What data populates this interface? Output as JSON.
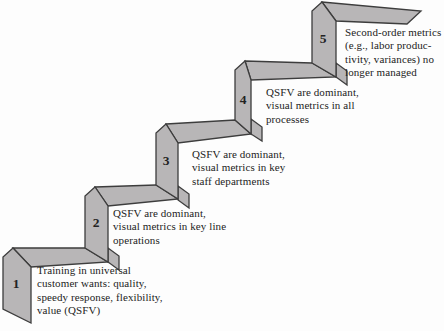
{
  "diagram": {
    "type": "staircase-maturity-diagram",
    "colors": {
      "background": "#fdfdfd",
      "shape_fill": "#b8b6b7",
      "shape_stroke": "#3d3d3d",
      "text": "#232323"
    },
    "steps": [
      {
        "number": "1",
        "label_lines": [
          "Training in universal",
          "customer wants: quality,",
          "speedy response, flexibility,",
          "value (QSFV)"
        ]
      },
      {
        "number": "2",
        "label_lines": [
          "QSFV are dominant,",
          "visual metrics in key line",
          "operations"
        ]
      },
      {
        "number": "3",
        "label_lines": [
          "QSFV are dominant,",
          "visual metrics in key",
          "staff departments"
        ]
      },
      {
        "number": "4",
        "label_lines": [
          "QSFV are dominant,",
          "visual metrics in all",
          "processes"
        ]
      },
      {
        "number": "5",
        "label_lines": [
          "Second-order metrics",
          "(e.g., labor produc-",
          "tivity, variances) no",
          "longer managed"
        ]
      }
    ]
  }
}
